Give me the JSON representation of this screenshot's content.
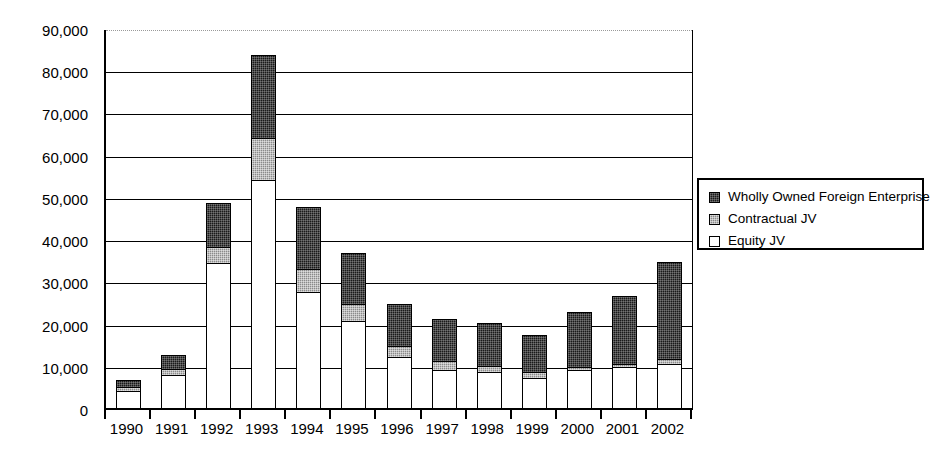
{
  "chart_data": {
    "type": "bar",
    "stacked": true,
    "title": "",
    "subtitle": "",
    "xlabel": "",
    "ylabel": "",
    "grid": true,
    "legend_position": "right",
    "ylim": [
      0,
      90000
    ],
    "ytick_step": 10000,
    "ytick_labels": [
      "0",
      "10,000",
      "20,000",
      "30,000",
      "40,000",
      "50,000",
      "60,000",
      "70,000",
      "80,000",
      "90,000"
    ],
    "ytick_values": [
      0,
      10000,
      20000,
      30000,
      40000,
      50000,
      60000,
      70000,
      80000,
      90000
    ],
    "categories": [
      "1990",
      "1991",
      "1992",
      "1993",
      "1994",
      "1995",
      "1996",
      "1997",
      "1998",
      "1999",
      "2000",
      "2001",
      "2002"
    ],
    "series": [
      {
        "name": "Equity JV",
        "color": "#ffffff",
        "values": [
          4500,
          8400,
          34900,
          54500,
          28000,
          21000,
          12600,
          9500,
          8900,
          7500,
          9400,
          10100,
          11000
        ]
      },
      {
        "name": "Contractual JV",
        "color": "#8a8a8a",
        "values": [
          1000,
          1300,
          3600,
          10000,
          5500,
          4100,
          2600,
          2100,
          1600,
          1500,
          900,
          800,
          1000
        ]
      },
      {
        "name": "Wholly Owned Foreign Enterprise",
        "color": "#1a1a1a",
        "values": [
          1500,
          3300,
          10500,
          19500,
          14500,
          12100,
          9800,
          9900,
          10000,
          8800,
          13000,
          16100,
          23000
        ]
      }
    ],
    "totals": [
      7000,
      13000,
      49000,
      84000,
      48000,
      37200,
      25000,
      21500,
      20500,
      17800,
      23300,
      27000,
      35000
    ]
  },
  "legend": {
    "items": [
      {
        "label": "Wholly Owned Foreign Enterprise",
        "swatch": "wholly"
      },
      {
        "label": "Contractual JV",
        "swatch": "contractual"
      },
      {
        "label": "Equity JV",
        "swatch": "equity"
      }
    ]
  }
}
